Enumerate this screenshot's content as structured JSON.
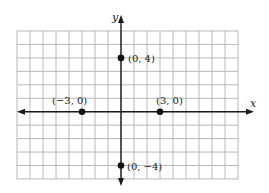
{
  "diagram": {
    "type": "coordinate-plane",
    "axes": {
      "x_label": "x",
      "y_label": "y"
    },
    "grid": {
      "cols": 17,
      "rows": 11,
      "origin_col": 8,
      "origin_row": 6,
      "line_color": "#b8b8b8",
      "axis_color": "#1a1a1a"
    },
    "points": [
      {
        "x": 0,
        "y": 4,
        "label": "(0, 4)"
      },
      {
        "x": -3,
        "y": 0,
        "label": "(−3, 0)"
      },
      {
        "x": 3,
        "y": 0,
        "label": "(3, 0)"
      },
      {
        "x": 0,
        "y": -4,
        "label": "(0, −4)"
      }
    ]
  },
  "chart_data": {
    "type": "scatter",
    "title": "",
    "xlabel": "x",
    "ylabel": "y",
    "points": [
      {
        "x": 0,
        "y": 4,
        "label": "(0, 4)"
      },
      {
        "x": -3,
        "y": 0,
        "label": "(-3, 0)"
      },
      {
        "x": 3,
        "y": 0,
        "label": "(3, 0)"
      },
      {
        "x": 0,
        "y": -4,
        "label": "(0, -4)"
      }
    ],
    "xlim": [
      -8,
      9
    ],
    "ylim": [
      -5,
      6
    ],
    "grid": true
  }
}
